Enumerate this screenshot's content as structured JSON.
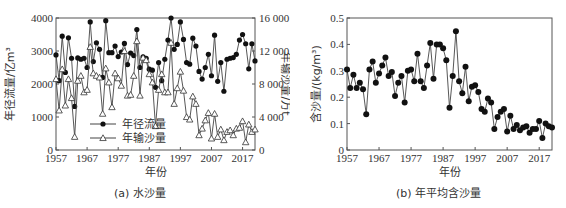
{
  "chart_data": [
    {
      "type": "line",
      "panel": "a",
      "caption": "(a) 水沙量",
      "xlabel": "年份",
      "ylabel": "年径流量/亿m³",
      "ylabel_right": "年输沙量/万t",
      "xticks": [
        "1957",
        "1967",
        "1977",
        "1987",
        "1997",
        "2007",
        "2017"
      ],
      "yticks": [
        "0",
        "1000",
        "2000",
        "3000",
        "4000"
      ],
      "yticks_right": [
        "0",
        "4 000",
        "8 000",
        "12 000",
        "16 000"
      ],
      "ylim": [
        0,
        4000
      ],
      "ylim_right": [
        0,
        16000
      ],
      "xlim": [
        1957,
        2021
      ],
      "legend": [
        "年径流量",
        "年输沙量"
      ],
      "legend_position": "lower-left",
      "x": [
        1957,
        1958,
        1959,
        1960,
        1961,
        1962,
        1963,
        1964,
        1965,
        1966,
        1967,
        1968,
        1969,
        1970,
        1971,
        1972,
        1973,
        1974,
        1975,
        1976,
        1977,
        1978,
        1979,
        1980,
        1981,
        1982,
        1983,
        1984,
        1985,
        1986,
        1987,
        1988,
        1989,
        1990,
        1991,
        1992,
        1993,
        1994,
        1995,
        1996,
        1997,
        1998,
        1999,
        2000,
        2001,
        2002,
        2003,
        2004,
        2005,
        2006,
        2007,
        2008,
        2009,
        2010,
        2011,
        2012,
        2013,
        2014,
        2015,
        2016,
        2017,
        2018,
        2019,
        2020,
        2021
      ],
      "series": [
        {
          "name": "年径流量",
          "axis": "left",
          "marker": "filled-circle",
          "values": [
            2880,
            2100,
            3450,
            2350,
            3400,
            2780,
            1320,
            2790,
            2750,
            2780,
            2500,
            3880,
            2680,
            3250,
            3050,
            2200,
            3920,
            2950,
            2950,
            3150,
            2830,
            2970,
            3230,
            2590,
            2940,
            2860,
            3650,
            2500,
            2820,
            2780,
            2450,
            2420,
            1900,
            2650,
            2100,
            2750,
            3330,
            4000,
            3050,
            3200,
            3880,
            3350,
            2650,
            2600,
            3390,
            3150,
            2380,
            2150,
            2500,
            2900,
            2250,
            3480,
            2080,
            2650,
            1780,
            2750,
            2780,
            2800,
            2900,
            3330,
            3500,
            3220,
            2460,
            3220,
            2700
          ]
        },
        {
          "name": "年输沙量",
          "axis": "right",
          "marker": "hollow-triangle",
          "values": [
            8600,
            4800,
            9800,
            5400,
            8600,
            6300,
            1600,
            8400,
            9000,
            7000,
            7300,
            12500,
            9300,
            9000,
            8800,
            4400,
            9900,
            8200,
            5200,
            9300,
            8700,
            7800,
            12000,
            6600,
            6700,
            9000,
            13200,
            6600,
            11200,
            10900,
            9200,
            8200,
            2900,
            7300,
            9200,
            7000,
            7000,
            13000,
            5600,
            7500,
            9500,
            7200,
            4000,
            3700,
            6500,
            5600,
            1800,
            2600,
            3600,
            4500,
            1400,
            4400,
            1600,
            2500,
            1200,
            2200,
            2400,
            1800,
            2600,
            2700,
            3500,
            950,
            3100,
            2200,
            2500
          ]
        }
      ]
    },
    {
      "type": "line",
      "panel": "b",
      "caption": "(b) 年平均含沙量",
      "xlabel": "年份",
      "ylabel": "含沙量/(kg/m³)",
      "xticks": [
        "1957",
        "1967",
        "1977",
        "1987",
        "1997",
        "2007",
        "2017"
      ],
      "yticks": [
        "0",
        "0.1",
        "0.2",
        "0.3",
        "0.4",
        "0.5"
      ],
      "ylim": [
        0,
        0.5
      ],
      "xlim": [
        1957,
        2021
      ],
      "marker": "filled-circle",
      "x": [
        1957,
        1958,
        1959,
        1960,
        1961,
        1962,
        1963,
        1964,
        1965,
        1966,
        1967,
        1968,
        1969,
        1970,
        1971,
        1972,
        1973,
        1974,
        1975,
        1976,
        1977,
        1978,
        1979,
        1980,
        1981,
        1982,
        1983,
        1984,
        1985,
        1986,
        1987,
        1988,
        1989,
        1990,
        1991,
        1992,
        1993,
        1994,
        1995,
        1996,
        1997,
        1998,
        1999,
        2000,
        2001,
        2002,
        2003,
        2004,
        2005,
        2006,
        2007,
        2008,
        2009,
        2010,
        2011,
        2012,
        2013,
        2014,
        2015,
        2016,
        2017,
        2018,
        2019,
        2020,
        2021
      ],
      "series": [
        {
          "name": "年平均含沙量",
          "values": [
            0.305,
            0.235,
            0.285,
            0.235,
            0.255,
            0.23,
            0.135,
            0.305,
            0.335,
            0.255,
            0.29,
            0.32,
            0.35,
            0.28,
            0.295,
            0.205,
            0.255,
            0.28,
            0.18,
            0.3,
            0.305,
            0.26,
            0.365,
            0.26,
            0.235,
            0.32,
            0.405,
            0.27,
            0.4,
            0.4,
            0.385,
            0.34,
            0.16,
            0.28,
            0.45,
            0.26,
            0.215,
            0.315,
            0.185,
            0.24,
            0.245,
            0.22,
            0.155,
            0.145,
            0.195,
            0.18,
            0.08,
            0.125,
            0.145,
            0.155,
            0.07,
            0.13,
            0.08,
            0.095,
            0.075,
            0.085,
            0.09,
            0.065,
            0.08,
            0.08,
            0.11,
            0.045,
            0.1,
            0.09,
            0.085
          ]
        }
      ]
    }
  ]
}
